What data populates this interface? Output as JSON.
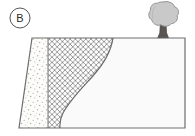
{
  "figure": {
    "panel_label": "B",
    "type": "geologic-block-diagram",
    "background_color": "#ffffff"
  },
  "panel_marker": {
    "label": "B",
    "shape": "circle",
    "center_x": 20,
    "center_y": 18,
    "radius": 10,
    "stroke_color": "#555555",
    "text_color": "#2b2b2b"
  },
  "block": {
    "name": "cross-section-block",
    "outline_color": "#6e6e6e",
    "top_left_x": 32,
    "top_right_x": 185,
    "top_y": 38,
    "bottom_left_x": 19,
    "bottom_right_x": 185,
    "bottom_y": 128
  },
  "units": [
    {
      "id": "stippled-unit",
      "name": "stippled-sediment-unit",
      "pattern": "stipple",
      "fill_color": "#fcfcfa",
      "dot_color": "#b9b2a6",
      "left_boundary": "block-left-edge",
      "right_boundary_x": 48
    },
    {
      "id": "crosshatch-unit",
      "name": "crosshatched-rock-unit",
      "pattern": "diagonal-crosshatch",
      "fill_color": "#fdfdfd",
      "line_color": "#8d8d8d",
      "mesh_spacing_px": 4,
      "left_boundary_x": 48,
      "right_boundary": "erosional-contact-curve"
    },
    {
      "id": "blank-unit",
      "name": "blank-fill-unit",
      "pattern": "none",
      "fill_color": "#fafafa",
      "left_boundary": "erosional-contact-curve",
      "right_boundary": "block-right-edge"
    }
  ],
  "contact": {
    "name": "erosional-contact-curve",
    "stroke_color": "#6b6b6b",
    "top_x": 113,
    "top_y": 38,
    "bottom_x": 60,
    "bottom_y": 127
  },
  "tree": {
    "name": "tree-symbol",
    "canopy_fill": "#c9c9c9",
    "canopy_stroke": "#8a8a8a",
    "trunk_fill": "#5a5550",
    "trunk_stroke": "#4a4540",
    "canopy_center_x": 163,
    "canopy_center_y": 15,
    "canopy_radius": 13,
    "base_x": 163,
    "base_y": 38
  }
}
